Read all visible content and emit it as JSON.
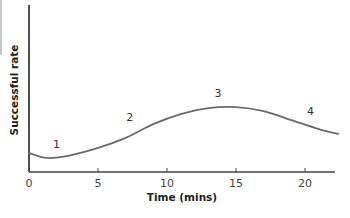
{
  "chart_data": {
    "type": "line",
    "title": "",
    "xlabel": "Time (mins)",
    "ylabel": "Successful rate",
    "xlim": [
      0,
      22.5
    ],
    "ylim": [
      0,
      10
    ],
    "x_ticks": [
      0,
      5,
      10,
      15,
      20
    ],
    "x_tick_labels": [
      "0",
      "5",
      "10",
      "15",
      "20"
    ],
    "y_ticks": [],
    "grid": false,
    "legend": null,
    "series": [
      {
        "name": "Successful rate",
        "color": "#6a6a6a",
        "x": [
          0,
          1.3,
          3,
          5,
          7,
          9,
          11,
          13,
          15,
          17,
          19,
          21,
          22.4
        ],
        "y": [
          1.14,
          0.84,
          1.0,
          1.44,
          2.04,
          2.87,
          3.47,
          3.83,
          3.89,
          3.65,
          3.11,
          2.57,
          2.28
        ]
      }
    ],
    "annotations": [
      {
        "text": "1",
        "x": 2.0,
        "y": 1.45
      },
      {
        "text": "2",
        "x": 7.3,
        "y": 3.05
      },
      {
        "text": "3",
        "x": 13.7,
        "y": 4.5
      },
      {
        "text": "4",
        "x": 20.4,
        "y": 3.4
      }
    ]
  }
}
